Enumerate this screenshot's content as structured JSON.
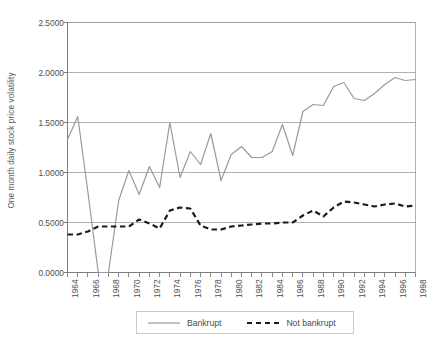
{
  "chart_data": {
    "type": "line",
    "title": "",
    "xlabel": "",
    "ylabel": "One month daily stock price volatility",
    "xlim": [
      1964,
      1998
    ],
    "ylim": [
      0.0,
      2.5
    ],
    "grid": true,
    "legend_position": "bottom",
    "y_ticks": [
      "0.0000",
      "0.5000",
      "1.0000",
      "1.5000",
      "2.0000",
      "2.5000"
    ],
    "y_tick_values": [
      0.0,
      0.5,
      1.0,
      1.5,
      2.0,
      2.5
    ],
    "x_ticks": [
      "1964",
      "1966",
      "1968",
      "1970",
      "1972",
      "1974",
      "1976",
      "1978",
      "1980",
      "1982",
      "1984",
      "1986",
      "1988",
      "1990",
      "1992",
      "1994",
      "1996",
      "1998"
    ],
    "x_tick_values": [
      1964,
      1966,
      1968,
      1970,
      1972,
      1974,
      1976,
      1978,
      1980,
      1982,
      1984,
      1986,
      1988,
      1990,
      1992,
      1994,
      1996,
      1998
    ],
    "x": [
      1964,
      1965,
      1966,
      1967,
      1968,
      1969,
      1970,
      1971,
      1972,
      1973,
      1974,
      1975,
      1976,
      1977,
      1978,
      1979,
      1980,
      1981,
      1982,
      1983,
      1984,
      1985,
      1986,
      1987,
      1988,
      1989,
      1990,
      1991,
      1992,
      1993,
      1994,
      1995,
      1996,
      1997,
      1998
    ],
    "series": [
      {
        "name": "Bankrupt",
        "style": "solid",
        "color": "#9a9a9a",
        "values": [
          1.33,
          1.56,
          0.8,
          0.0,
          0.0,
          0.72,
          1.02,
          0.78,
          1.06,
          0.85,
          1.5,
          0.95,
          1.21,
          1.08,
          1.39,
          0.92,
          1.18,
          1.26,
          1.15,
          1.15,
          1.21,
          1.48,
          1.17,
          1.61,
          1.68,
          1.67,
          1.86,
          1.9,
          1.74,
          1.72,
          1.79,
          1.88,
          1.95,
          1.92,
          1.93
        ]
      },
      {
        "name": "Not bankrupt",
        "style": "dashed",
        "color": "#1c1c1c",
        "values": [
          0.38,
          0.38,
          0.41,
          0.46,
          0.46,
          0.46,
          0.46,
          0.53,
          0.49,
          0.44,
          0.62,
          0.65,
          0.64,
          0.47,
          0.43,
          0.43,
          0.46,
          0.47,
          0.48,
          0.49,
          0.49,
          0.5,
          0.5,
          0.57,
          0.62,
          0.56,
          0.65,
          0.71,
          0.7,
          0.68,
          0.66,
          0.68,
          0.69,
          0.66,
          0.67
        ]
      }
    ],
    "legend": [
      {
        "label": "Bankrupt",
        "style": "solid",
        "color": "#9a9a9a"
      },
      {
        "label": "Not bankrupt",
        "style": "dashed",
        "color": "#1c1c1c"
      }
    ],
    "axis_color": "#7d7d7d",
    "grid_color": "#9e9e9e"
  }
}
